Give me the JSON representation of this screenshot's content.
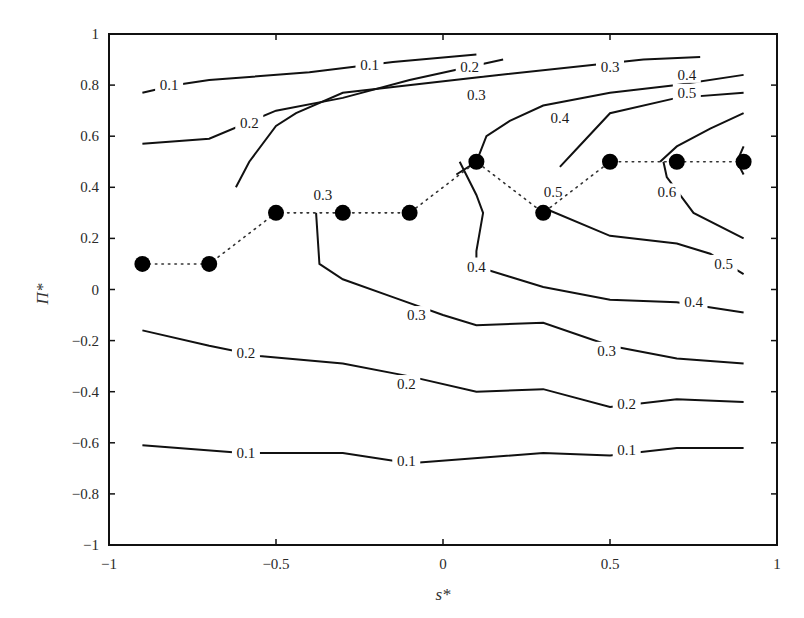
{
  "chart_data": {
    "type": "contour",
    "title": "",
    "xlabel": "s*",
    "ylabel": "Π*",
    "xlim": [
      -1,
      1
    ],
    "ylim": [
      -1,
      1
    ],
    "x_ticks": [
      "-1",
      "-0.5",
      "0",
      "0.5",
      "1"
    ],
    "y_ticks": [
      "-1",
      "-0.8",
      "-0.6",
      "-0.4",
      "-0.2",
      "0",
      "0.2",
      "0.4",
      "0.6",
      "0.8",
      "1"
    ],
    "grid": false,
    "legend": null,
    "contour_levels": [
      0.1,
      0.2,
      0.3,
      0.4,
      0.5,
      0.6
    ],
    "contours": [
      {
        "level": 0.1,
        "region": "upper",
        "points": [
          [
            -0.9,
            0.77
          ],
          [
            -0.8,
            0.8
          ],
          [
            -0.7,
            0.82
          ],
          [
            -0.4,
            0.85
          ],
          [
            -0.15,
            0.89
          ],
          [
            0.1,
            0.92
          ]
        ]
      },
      {
        "level": 0.2,
        "region": "upper",
        "points": [
          [
            -0.9,
            0.57
          ],
          [
            -0.7,
            0.59
          ],
          [
            -0.5,
            0.7
          ],
          [
            -0.3,
            0.75
          ],
          [
            -0.1,
            0.82
          ],
          [
            0.18,
            0.9
          ]
        ]
      },
      {
        "level": 0.3,
        "region": "upper",
        "points": [
          [
            -0.62,
            0.4
          ],
          [
            -0.58,
            0.5
          ],
          [
            -0.5,
            0.64
          ],
          [
            -0.44,
            0.69
          ],
          [
            -0.3,
            0.77
          ],
          [
            0.1,
            0.83
          ],
          [
            0.6,
            0.9
          ],
          [
            0.77,
            0.91
          ]
        ]
      },
      {
        "level": 0.4,
        "region": "upper",
        "points": [
          [
            0.04,
            0.45
          ],
          [
            0.1,
            0.5
          ],
          [
            0.13,
            0.6
          ],
          [
            0.2,
            0.66
          ],
          [
            0.3,
            0.72
          ],
          [
            0.5,
            0.77
          ],
          [
            0.7,
            0.8
          ],
          [
            0.9,
            0.84
          ]
        ]
      },
      {
        "level": 0.5,
        "region": "upper",
        "points": [
          [
            0.35,
            0.48
          ],
          [
            0.4,
            0.55
          ],
          [
            0.5,
            0.69
          ],
          [
            0.7,
            0.75
          ],
          [
            0.9,
            0.77
          ]
        ]
      },
      {
        "level": 0.6,
        "region": "upper",
        "points": [
          [
            0.65,
            0.5
          ],
          [
            0.7,
            0.56
          ],
          [
            0.8,
            0.63
          ],
          [
            0.9,
            0.69
          ]
        ]
      },
      {
        "level": 0.3,
        "region": "mid",
        "points": [
          [
            -0.38,
            0.3
          ],
          [
            -0.37,
            0.1
          ],
          [
            -0.3,
            0.04
          ],
          [
            -0.15,
            -0.03
          ],
          [
            0.0,
            -0.1
          ],
          [
            0.1,
            -0.14
          ],
          [
            0.3,
            -0.13
          ],
          [
            0.5,
            -0.22
          ],
          [
            0.7,
            -0.27
          ],
          [
            0.9,
            -0.29
          ]
        ]
      },
      {
        "level": 0.4,
        "region": "mid",
        "points": [
          [
            0.05,
            0.5
          ],
          [
            0.1,
            0.37
          ],
          [
            0.12,
            0.3
          ],
          [
            0.1,
            0.15
          ],
          [
            0.1,
            0.09
          ],
          [
            0.2,
            0.05
          ],
          [
            0.3,
            0.01
          ],
          [
            0.5,
            -0.04
          ],
          [
            0.7,
            -0.05
          ],
          [
            0.9,
            -0.09
          ]
        ]
      },
      {
        "level": 0.5,
        "region": "mid",
        "points": [
          [
            0.3,
            0.32
          ],
          [
            0.5,
            0.21
          ],
          [
            0.7,
            0.18
          ],
          [
            0.8,
            0.14
          ],
          [
            0.9,
            0.06
          ]
        ]
      },
      {
        "level": 0.6,
        "region": "mid",
        "points": [
          [
            0.66,
            0.5
          ],
          [
            0.67,
            0.44
          ],
          [
            0.75,
            0.3
          ],
          [
            0.9,
            0.2
          ]
        ]
      },
      {
        "level": 0.6,
        "region": "corner",
        "points": [
          [
            0.9,
            0.56
          ],
          [
            0.88,
            0.5
          ],
          [
            0.9,
            0.45
          ]
        ]
      },
      {
        "level": 0.2,
        "region": "lower",
        "points": [
          [
            -0.9,
            -0.16
          ],
          [
            -0.7,
            -0.22
          ],
          [
            -0.55,
            -0.26
          ],
          [
            -0.3,
            -0.29
          ],
          [
            -0.1,
            -0.34
          ],
          [
            0.1,
            -0.4
          ],
          [
            0.3,
            -0.39
          ],
          [
            0.5,
            -0.46
          ],
          [
            0.7,
            -0.43
          ],
          [
            0.9,
            -0.44
          ]
        ]
      },
      {
        "level": 0.1,
        "region": "lower",
        "points": [
          [
            -0.9,
            -0.61
          ],
          [
            -0.6,
            -0.64
          ],
          [
            -0.3,
            -0.64
          ],
          [
            -0.1,
            -0.68
          ],
          [
            0.3,
            -0.64
          ],
          [
            0.5,
            -0.65
          ],
          [
            0.7,
            -0.62
          ],
          [
            0.9,
            -0.62
          ]
        ]
      }
    ],
    "contour_labels": [
      {
        "text": "0.1",
        "x": -0.82,
        "y": 0.8
      },
      {
        "text": "0.1",
        "x": -0.22,
        "y": 0.88
      },
      {
        "text": "0.2",
        "x": -0.58,
        "y": 0.65
      },
      {
        "text": "0.2",
        "x": 0.08,
        "y": 0.87
      },
      {
        "text": "0.3",
        "x": 0.1,
        "y": 0.76
      },
      {
        "text": "0.3",
        "x": 0.5,
        "y": 0.87
      },
      {
        "text": "0.4",
        "x": 0.73,
        "y": 0.84
      },
      {
        "text": "0.5",
        "x": 0.73,
        "y": 0.77
      },
      {
        "text": "0.4",
        "x": 0.35,
        "y": 0.67
      },
      {
        "text": "0.3",
        "x": -0.36,
        "y": 0.37
      },
      {
        "text": "0.5",
        "x": 0.33,
        "y": 0.38
      },
      {
        "text": "0.6",
        "x": 0.67,
        "y": 0.38
      },
      {
        "text": "0.4",
        "x": 0.1,
        "y": 0.09
      },
      {
        "text": "0.5",
        "x": 0.84,
        "y": 0.1
      },
      {
        "text": "0.3",
        "x": -0.08,
        "y": -0.1
      },
      {
        "text": "0.4",
        "x": 0.75,
        "y": -0.05
      },
      {
        "text": "0.3",
        "x": 0.49,
        "y": -0.24
      },
      {
        "text": "0.2",
        "x": -0.59,
        "y": -0.25
      },
      {
        "text": "0.2",
        "x": -0.11,
        "y": -0.37
      },
      {
        "text": "0.2",
        "x": 0.55,
        "y": -0.45
      },
      {
        "text": "0.1",
        "x": -0.59,
        "y": -0.64
      },
      {
        "text": "0.1",
        "x": -0.11,
        "y": -0.67
      },
      {
        "text": "0.1",
        "x": 0.55,
        "y": -0.63
      }
    ],
    "series": [
      {
        "name": "optimal path",
        "style": "dotted line with filled circle markers",
        "x": [
          -0.9,
          -0.7,
          -0.5,
          -0.3,
          -0.1,
          0.1,
          0.3,
          0.5,
          0.7,
          0.9
        ],
        "y": [
          0.1,
          0.1,
          0.3,
          0.3,
          0.3,
          0.5,
          0.3,
          0.5,
          0.5,
          0.5
        ]
      }
    ]
  }
}
